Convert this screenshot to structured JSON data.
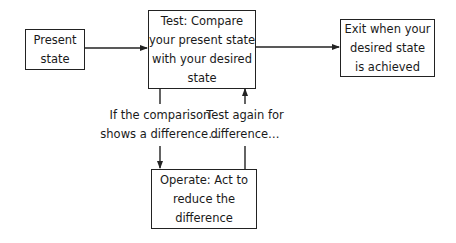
{
  "diagram": {
    "type": "flowchart",
    "nodes": [
      {
        "id": "present",
        "lines": [
          "Present",
          "state"
        ]
      },
      {
        "id": "test",
        "lines": [
          "Test: Compare",
          "your present state",
          "with your desired",
          "state"
        ]
      },
      {
        "id": "exit",
        "lines": [
          "Exit when your",
          "desired state",
          "is achieved"
        ]
      },
      {
        "id": "operate",
        "lines": [
          "Operate: Act to",
          "reduce the",
          "difference"
        ]
      }
    ],
    "edges": [
      {
        "from": "present",
        "to": "test",
        "label": ""
      },
      {
        "from": "test",
        "to": "exit",
        "label": ""
      },
      {
        "from": "test",
        "to": "operate",
        "label_lines": [
          "If the comparison",
          "shows a difference…"
        ]
      },
      {
        "from": "operate",
        "to": "test",
        "label_lines": [
          "Test again for",
          "difference…"
        ]
      }
    ],
    "colors": {
      "stroke": "#222222",
      "background": "#ffffff",
      "text": "#1a1a1a"
    }
  }
}
